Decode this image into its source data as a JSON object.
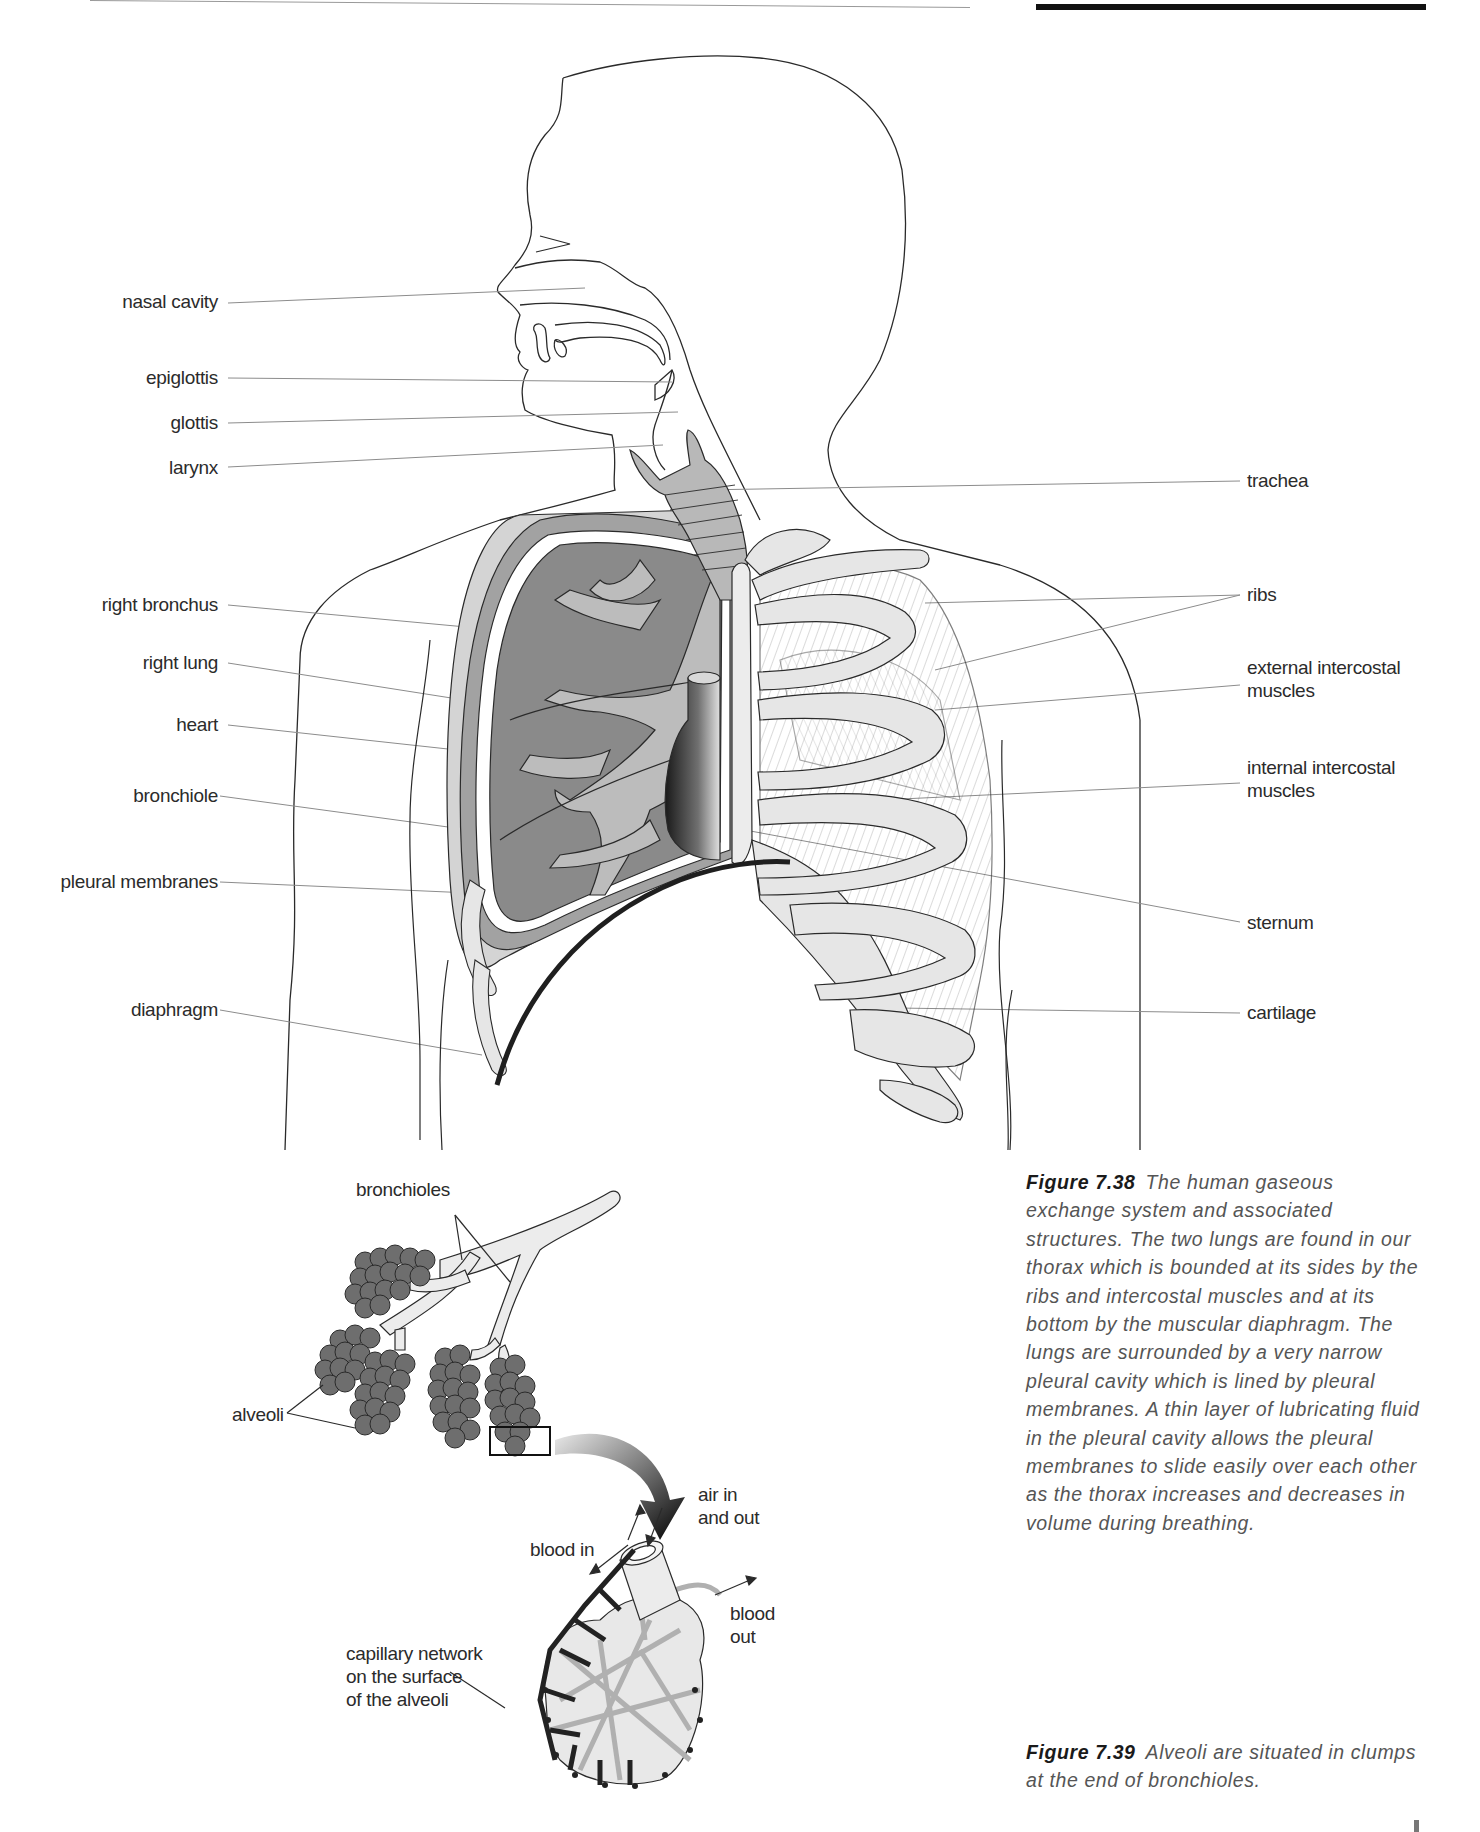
{
  "page": {
    "header_rules": [
      "thin-rule",
      "thick-rule"
    ]
  },
  "figure_738": {
    "labels_left": [
      {
        "key": "nasal_cavity",
        "text": "nasal cavity"
      },
      {
        "key": "epiglottis",
        "text": "epiglottis"
      },
      {
        "key": "glottis",
        "text": "glottis"
      },
      {
        "key": "larynx",
        "text": "larynx"
      },
      {
        "key": "right_bronchus",
        "text": "right bronchus"
      },
      {
        "key": "right_lung",
        "text": "right lung"
      },
      {
        "key": "heart",
        "text": "heart"
      },
      {
        "key": "bronchiole",
        "text": "bronchiole"
      },
      {
        "key": "pleural_membranes",
        "text": "pleural membranes"
      },
      {
        "key": "diaphragm",
        "text": "diaphragm"
      }
    ],
    "labels_right": [
      {
        "key": "trachea",
        "text": "trachea"
      },
      {
        "key": "ribs",
        "text": "ribs"
      },
      {
        "key": "external_intercostal",
        "line1": "external intercostal",
        "line2": "muscles"
      },
      {
        "key": "internal_intercostal",
        "line1": "internal intercostal",
        "line2": "muscles"
      },
      {
        "key": "sternum",
        "text": "sternum"
      },
      {
        "key": "cartilage",
        "text": "cartilage"
      }
    ],
    "caption": {
      "figure_number": "Figure 7.38",
      "text": "The human gaseous exchange system and associated structures. The two lungs are found in our thorax which is bounded at its sides by the ribs and intercostal muscles and at its bottom by the muscular diaphragm. The lungs are surrounded by a very narrow pleural cavity which is lined by pleural membranes. A thin layer of lubricating fluid in the pleural cavity allows the pleural membranes to slide easily over each other as the thorax increases and decreases in volume during breathing."
    }
  },
  "figure_739": {
    "labels": {
      "bronchioles": "bronchioles",
      "alveoli": "alveoli",
      "air_in": "air in",
      "and_out": "and out",
      "blood_in": "blood in",
      "blood": "blood",
      "out": "out",
      "capillary_1": "capillary network",
      "capillary_2": "on the surface",
      "capillary_3": "of the alveoli"
    },
    "caption": {
      "figure_number": "Figure 7.39",
      "text": "Alveoli are situated in clumps at the end of bronchioles."
    }
  },
  "colors": {
    "outline": "#2a2a2a",
    "lung_dark": "#8a8a8a",
    "lung_mid": "#a8a8a8",
    "airway_light": "#c8c8c8",
    "bone": "#e6e6e6",
    "alveoli": "#6e6e6e",
    "capillary_dark": "#2a2a2a",
    "capillary_light": "#b0b0b0",
    "leader_line": "#8c8c8c"
  }
}
